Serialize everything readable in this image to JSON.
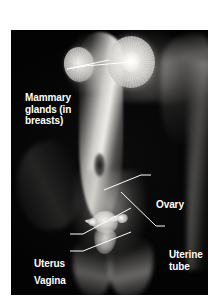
{
  "figure": {
    "type": "anatomical-photograph",
    "background_color": "#ffffff",
    "plate_color": "#030303",
    "label_color": "#ffffff",
    "leader_line_color": "#ffffff"
  },
  "labels": {
    "mammary": "Mammary\nglands (in\nbreasts)",
    "ovary": "Ovary",
    "uterine_tube": "Uterine\ntube",
    "uterus": "Uterus",
    "vagina": "Vagina"
  },
  "structures": [
    {
      "id": "gland-left",
      "name": "Mammary gland (left breast)"
    },
    {
      "id": "gland-right",
      "name": "Mammary gland (right breast)"
    },
    {
      "id": "ovary-left",
      "name": "Ovary (left)"
    },
    {
      "id": "ovary-right",
      "name": "Ovary (right)"
    },
    {
      "id": "tube-left",
      "name": "Uterine tube (left)"
    },
    {
      "id": "tube-right",
      "name": "Uterine tube (right)"
    },
    {
      "id": "uterus-body",
      "name": "Uterus"
    },
    {
      "id": "cervix-vagina",
      "name": "Vagina"
    }
  ]
}
